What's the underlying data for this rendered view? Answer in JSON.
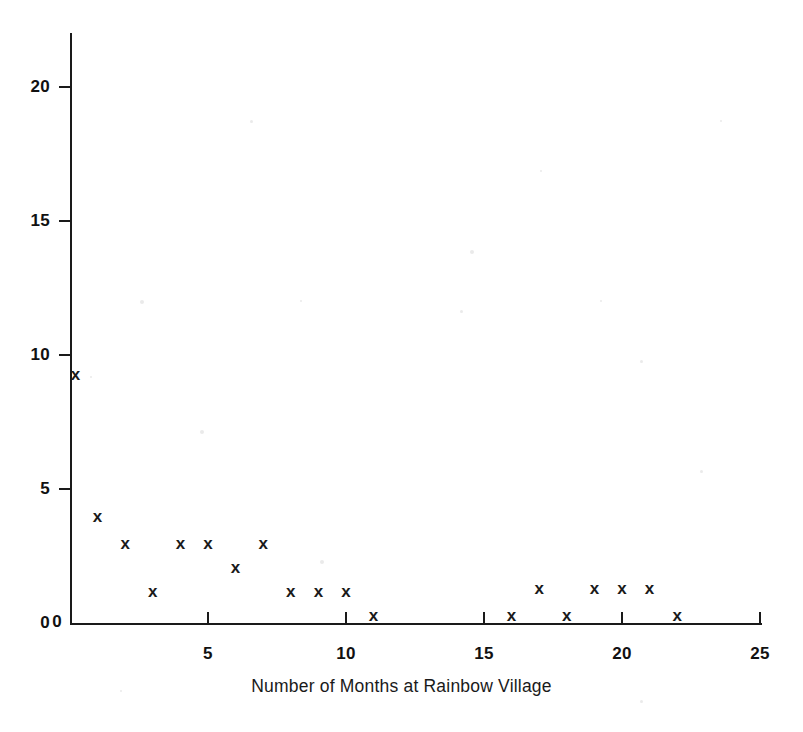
{
  "chart_data": {
    "type": "scatter",
    "title": "",
    "xlabel": "Number of Months at Rainbow Village",
    "ylabel": "",
    "xlim": [
      0,
      25
    ],
    "ylim": [
      0,
      21
    ],
    "xticks": [
      0,
      5,
      10,
      15,
      20,
      25
    ],
    "xtick_labels": [
      "0",
      "5",
      "10",
      "15",
      "20",
      "25"
    ],
    "yticks": [
      0,
      5,
      10,
      15,
      20
    ],
    "ytick_labels": [
      "0",
      "5",
      "10",
      "15",
      "20"
    ],
    "grid": false,
    "legend": null,
    "marker": "x",
    "marker_color": "#1a1a1a",
    "points": [
      {
        "x": 0.2,
        "y": 9.3
      },
      {
        "x": 1.0,
        "y": 4.0
      },
      {
        "x": 2.0,
        "y": 3.0
      },
      {
        "x": 3.0,
        "y": 1.2
      },
      {
        "x": 4.0,
        "y": 3.0
      },
      {
        "x": 5.0,
        "y": 3.0
      },
      {
        "x": 6.0,
        "y": 2.1
      },
      {
        "x": 7.0,
        "y": 3.0
      },
      {
        "x": 8.0,
        "y": 1.2
      },
      {
        "x": 9.0,
        "y": 1.2
      },
      {
        "x": 10.0,
        "y": 1.2
      },
      {
        "x": 11.0,
        "y": 0.3
      },
      {
        "x": 16.0,
        "y": 0.3
      },
      {
        "x": 17.0,
        "y": 1.3
      },
      {
        "x": 18.0,
        "y": 0.3
      },
      {
        "x": 19.0,
        "y": 1.3
      },
      {
        "x": 20.0,
        "y": 1.3
      },
      {
        "x": 21.0,
        "y": 1.3
      },
      {
        "x": 22.0,
        "y": 0.3
      }
    ]
  },
  "axes": {
    "x_title": "Number of Months at Rainbow Village",
    "x_tick_labels": [
      "0",
      "5",
      "10",
      "15",
      "20",
      "25"
    ],
    "y_tick_labels": [
      "0",
      "5",
      "10",
      "15",
      "20"
    ]
  },
  "marker_glyph": "x",
  "colors": {
    "ink": "#1a1a1a",
    "background": "#ffffff"
  },
  "geometry": {
    "x0_px": 70,
    "y0_px": 623,
    "px_per_x_unit": 27.6,
    "px_per_y_unit": 26.8
  }
}
